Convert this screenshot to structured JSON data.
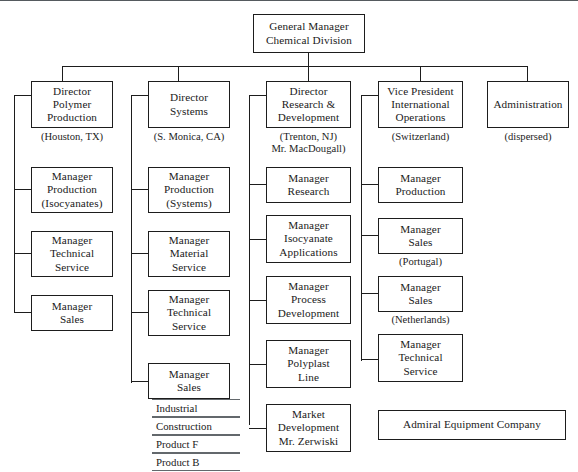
{
  "chart": {
    "title_box": {
      "id": "general-manager",
      "lines": [
        "General Manager",
        "Chemical Division"
      ]
    },
    "top_rule_color": "#555a5e",
    "divisions": [
      {
        "id": "polymer-production",
        "header": {
          "lines": [
            "Director",
            "Polymer",
            "Production"
          ]
        },
        "caption": [
          "(Houston, TX)"
        ],
        "children": [
          {
            "id": "mgr-production-isocyanates",
            "lines": [
              "Manager",
              "Production",
              "(Isocyanates)"
            ],
            "caption": []
          },
          {
            "id": "mgr-technical-service-polymer",
            "lines": [
              "Manager",
              "Technical",
              "Service"
            ],
            "caption": []
          },
          {
            "id": "mgr-sales-polymer",
            "lines": [
              "Manager",
              "Sales"
            ],
            "caption": []
          }
        ]
      },
      {
        "id": "systems",
        "header": {
          "lines": [
            "Director",
            "Systems"
          ]
        },
        "caption": [
          "(S. Monica, CA)"
        ],
        "children": [
          {
            "id": "mgr-production-systems",
            "lines": [
              "Manager",
              "Production",
              "(Systems)"
            ],
            "caption": []
          },
          {
            "id": "mgr-material-service",
            "lines": [
              "Manager",
              "Material",
              "Service"
            ],
            "caption": []
          },
          {
            "id": "mgr-technical-service-systems",
            "lines": [
              "Manager",
              "Technical",
              "Service"
            ],
            "caption": []
          },
          {
            "id": "mgr-sales-systems",
            "lines": [
              "Manager",
              "Sales"
            ],
            "caption": []
          }
        ],
        "sublist": [
          "Industrial",
          "Construction",
          "Product F",
          "Product B"
        ]
      },
      {
        "id": "research-development",
        "header": {
          "lines": [
            "Director",
            "Research &",
            "Development"
          ]
        },
        "caption": [
          "(Trenton, NJ)",
          "Mr. MacDougall)"
        ],
        "children": [
          {
            "id": "mgr-research",
            "lines": [
              "Manager",
              "Research"
            ],
            "caption": []
          },
          {
            "id": "mgr-isocyanate-applications",
            "lines": [
              "Manager",
              "Isocyanate",
              "Applications"
            ],
            "caption": []
          },
          {
            "id": "mgr-process-development",
            "lines": [
              "Manager",
              "Process",
              "Development"
            ],
            "caption": []
          },
          {
            "id": "mgr-polyplast-line",
            "lines": [
              "Manager",
              "Polyplast",
              "Line"
            ],
            "caption": []
          },
          {
            "id": "market-development",
            "lines": [
              "Market",
              "Development",
              "Mr. Zerwiski"
            ],
            "caption": []
          }
        ]
      },
      {
        "id": "international-operations",
        "header": {
          "lines": [
            "Vice President",
            "International",
            "Operations"
          ]
        },
        "caption": [
          "(Switzerland)"
        ],
        "children": [
          {
            "id": "mgr-production-intl",
            "lines": [
              "Manager",
              "Production"
            ],
            "caption": []
          },
          {
            "id": "mgr-sales-portugal",
            "lines": [
              "Manager",
              "Sales"
            ],
            "caption": [
              "(Portugal)"
            ]
          },
          {
            "id": "mgr-sales-netherlands",
            "lines": [
              "Manager",
              "Sales"
            ],
            "caption": [
              "(Netherlands)"
            ]
          },
          {
            "id": "mgr-technical-service-intl",
            "lines": [
              "Manager",
              "Technical",
              "Service"
            ],
            "caption": []
          }
        ]
      },
      {
        "id": "administration",
        "header": {
          "lines": [
            "Administration"
          ]
        },
        "caption": [
          "(dispersed)"
        ],
        "children": []
      }
    ],
    "standalone_box": {
      "id": "admiral-equipment-company",
      "lines": [
        "Admiral Equipment Company"
      ]
    }
  }
}
